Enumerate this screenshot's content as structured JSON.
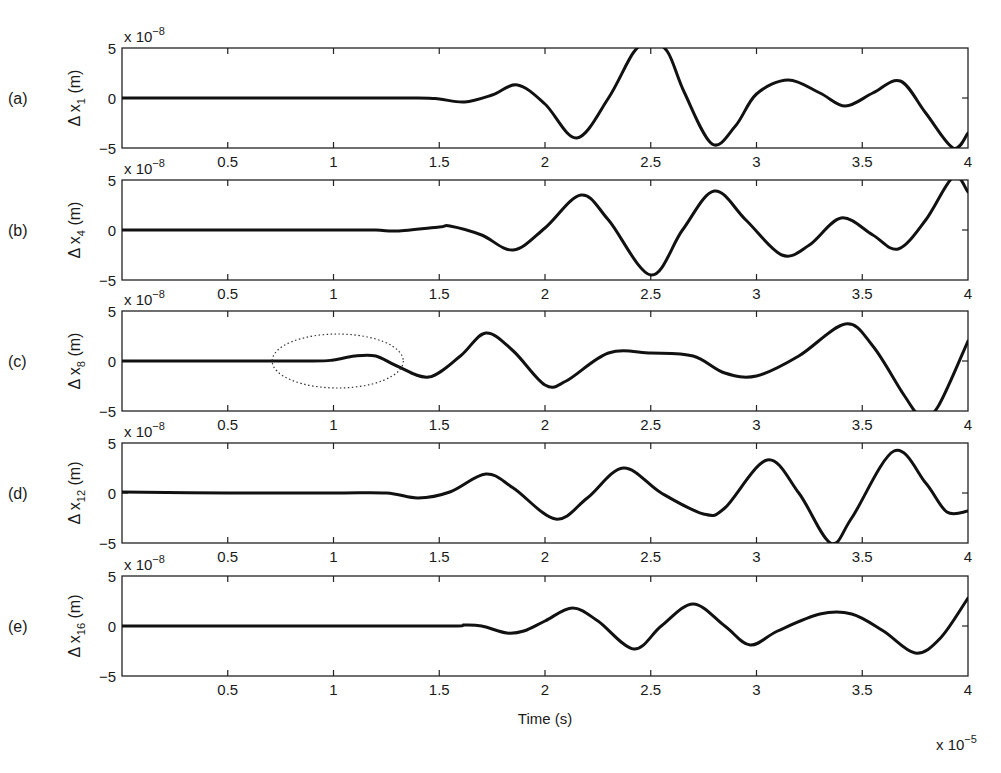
{
  "chart_data": {
    "type": "line",
    "title": "",
    "layout": "5 vertically stacked subplots sharing x-axis",
    "xlabel": "Time (s)",
    "x_multiplier": "x 10^-5",
    "x_multiplier_text": "x 10",
    "x_multiplier_exp": "−5",
    "xlim": [
      0,
      4
    ],
    "xticks": [
      0.5,
      1,
      1.5,
      2,
      2.5,
      3,
      3.5,
      4
    ],
    "xtick_labels": [
      "0.5",
      "1",
      "1.5",
      "2",
      "2.5",
      "3",
      "3.5",
      "4"
    ],
    "grid": false,
    "legend": null,
    "line_color": "#111111",
    "panels": [
      {
        "tag": "(a)",
        "ylabel_prefix": "Δ x",
        "ylabel_sub": "1",
        "ylabel_suffix": " (m)",
        "y_multiplier_text": "x 10",
        "y_multiplier_exp": "−8",
        "ylim": [
          -5,
          5
        ],
        "yticks": [
          -5,
          0,
          5
        ],
        "ytick_labels": [
          "−5",
          "0",
          "5"
        ],
        "x": [
          0,
          0.5,
          1.0,
          1.4,
          1.5,
          1.62,
          1.75,
          1.87,
          2.0,
          2.15,
          2.3,
          2.42,
          2.5,
          2.58,
          2.66,
          2.79,
          2.9,
          3.0,
          3.15,
          3.3,
          3.42,
          3.55,
          3.68,
          3.8,
          3.93,
          4.0
        ],
        "y": [
          0,
          0,
          0,
          0,
          -0.1,
          -0.4,
          0.3,
          1.3,
          -0.6,
          -4.0,
          0,
          4.6,
          5.6,
          4.6,
          0.5,
          -4.6,
          -2.8,
          0.4,
          1.8,
          0.5,
          -0.8,
          0.5,
          1.7,
          -1.5,
          -5.0,
          -3.5
        ]
      },
      {
        "tag": "(b)",
        "ylabel_prefix": "Δ x",
        "ylabel_sub": "4",
        "ylabel_suffix": " (m)",
        "y_multiplier_text": "x 10",
        "y_multiplier_exp": "−8",
        "ylim": [
          -5,
          5
        ],
        "yticks": [
          -5,
          0,
          5
        ],
        "ytick_labels": [
          "−5",
          "0",
          "5"
        ],
        "x": [
          0,
          0.5,
          1.0,
          1.2,
          1.3,
          1.5,
          1.55,
          1.7,
          1.85,
          2.0,
          2.17,
          2.3,
          2.5,
          2.65,
          2.8,
          2.95,
          3.12,
          3.25,
          3.4,
          3.55,
          3.67,
          3.8,
          3.93,
          4.0
        ],
        "y": [
          0,
          0,
          0,
          0,
          -0.1,
          0.3,
          0.4,
          -0.5,
          -2.0,
          0.2,
          3.5,
          1.0,
          -4.5,
          0,
          3.9,
          1.0,
          -2.5,
          -1.5,
          1.2,
          -0.5,
          -1.9,
          1.0,
          5.3,
          3.8
        ]
      },
      {
        "tag": "(c)",
        "ylabel_prefix": "Δ x",
        "ylabel_sub": "8",
        "ylabel_suffix": " (m)",
        "y_multiplier_text": "x 10",
        "y_multiplier_exp": "−8",
        "ylim": [
          -5,
          5
        ],
        "yticks": [
          -5,
          0,
          5
        ],
        "ytick_labels": [
          "−5",
          "0",
          "5"
        ],
        "x": [
          0,
          0.5,
          0.9,
          1.0,
          1.1,
          1.2,
          1.3,
          1.45,
          1.6,
          1.72,
          1.85,
          2.0,
          2.1,
          2.3,
          2.5,
          2.7,
          2.85,
          3.0,
          3.2,
          3.42,
          3.55,
          3.7,
          3.78,
          3.86,
          4.0
        ],
        "y": [
          0,
          0,
          0,
          0.1,
          0.5,
          0.5,
          -0.5,
          -1.6,
          0.5,
          2.8,
          1.0,
          -2.4,
          -2.0,
          0.8,
          0.8,
          0.5,
          -1.2,
          -1.5,
          0.5,
          3.7,
          1.5,
          -3.5,
          -5.6,
          -4.5,
          2.0
        ],
        "annotation": {
          "type": "dotted-ellipse",
          "center_x": 1.02,
          "center_y": 0,
          "rx": 0.31,
          "ry": 2.7,
          "note": "highlights early small disturbance"
        }
      },
      {
        "tag": "(d)",
        "ylabel_prefix": "Δ x",
        "ylabel_sub": "12",
        "ylabel_suffix": " (m)",
        "y_multiplier_text": "x 10",
        "y_multiplier_exp": "−8",
        "ylim": [
          -5,
          5
        ],
        "yticks": [
          -5,
          0,
          5
        ],
        "ytick_labels": [
          "−5",
          "0",
          "5"
        ],
        "x": [
          0,
          0.5,
          1.0,
          1.25,
          1.4,
          1.55,
          1.72,
          1.85,
          2.05,
          2.2,
          2.37,
          2.55,
          2.75,
          2.85,
          3.05,
          3.2,
          3.35,
          3.45,
          3.65,
          3.8,
          3.9,
          4.0
        ],
        "y": [
          0.1,
          0,
          0,
          0,
          -0.5,
          0.1,
          1.9,
          0.5,
          -2.6,
          -0.5,
          2.5,
          0,
          -2.1,
          -1.5,
          3.3,
          0,
          -5.0,
          -2.5,
          4.2,
          1.0,
          -1.9,
          -1.8
        ]
      },
      {
        "tag": "(e)",
        "ylabel_prefix": "Δ x",
        "ylabel_sub": "16",
        "ylabel_suffix": " (m)",
        "y_multiplier_text": "x 10",
        "y_multiplier_exp": "−8",
        "ylim": [
          -5,
          5
        ],
        "yticks": [
          -5,
          0,
          5
        ],
        "ytick_labels": [
          "−5",
          "0",
          "5"
        ],
        "x": [
          0,
          0.5,
          1.0,
          1.55,
          1.62,
          1.7,
          1.82,
          1.9,
          2.0,
          2.13,
          2.25,
          2.42,
          2.55,
          2.7,
          2.85,
          2.97,
          3.1,
          3.3,
          3.45,
          3.6,
          3.75,
          3.87,
          4.0
        ],
        "y": [
          0,
          0,
          0,
          0,
          0.1,
          0.0,
          -0.7,
          -0.5,
          0.5,
          1.8,
          0.5,
          -2.3,
          0,
          2.2,
          0,
          -1.9,
          -0.5,
          1.2,
          1.2,
          -0.5,
          -2.7,
          -1.2,
          2.8
        ]
      }
    ]
  }
}
